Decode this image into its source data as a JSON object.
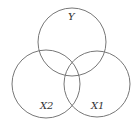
{
  "diagram": {
    "type": "venn",
    "stroke_color": "#777777",
    "sets": [
      {
        "id": "Y",
        "label": "Y",
        "cx": 72,
        "cy": 42,
        "r": 34
      },
      {
        "id": "X2",
        "label": "X2",
        "cx": 46,
        "cy": 84,
        "r": 34
      },
      {
        "id": "X1",
        "label": "X1",
        "cx": 97,
        "cy": 84,
        "r": 33
      }
    ]
  }
}
